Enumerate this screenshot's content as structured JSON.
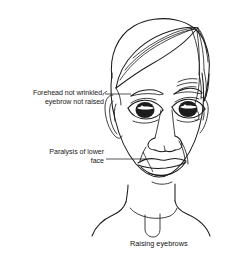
{
  "illustration": {
    "subject": "frontal view of a human head and neck, line drawing",
    "caption": "Raising eyebrows",
    "annotations": [
      {
        "id": "forehead",
        "line1": "Forehead not wrinkled,",
        "line2": "eyebrow not raised",
        "target": "left forehead and eyebrow"
      },
      {
        "id": "paralysis",
        "line1": "Paralysis of lower",
        "line2": "face",
        "target": "left lower face and mouth corner"
      }
    ]
  },
  "style": {
    "ink_color": "#1c1c1c",
    "background_color": "#ffffff",
    "text_color": "#1a1a1a"
  }
}
